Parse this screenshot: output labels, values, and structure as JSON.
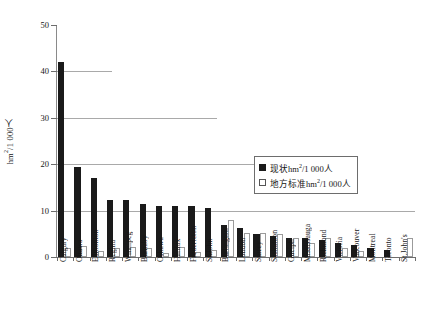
{
  "chart_data": {
    "type": "bar",
    "title": "",
    "xlabel": "",
    "ylabel": "hm²/1 000人",
    "ylim": [
      0,
      50
    ],
    "yticks": [
      0,
      10,
      20,
      30,
      40,
      50
    ],
    "grid": true,
    "legend_position": "center-right",
    "categories": [
      "Calgary",
      "Ottawa",
      "Edmonton",
      "Regina",
      "Winnipeg",
      "Burnaby",
      "Oshawa",
      "Halifax",
      "Fredericton",
      "St.John",
      "Burlington",
      "London",
      "Surrey",
      "Saskatoon",
      "Guelph",
      "Mississauga",
      "Richmond",
      "Victoria",
      "Vancouver",
      "Montreal",
      "Toronto",
      "St.John's"
    ],
    "series": [
      {
        "name": "现状hm²/1 000人",
        "color": "#1a1a1a",
        "values": [
          42.0,
          19.5,
          17.0,
          12.3,
          12.3,
          11.5,
          11.0,
          11.0,
          11.0,
          10.5,
          7.0,
          6.2,
          5.0,
          4.6,
          4.2,
          4.0,
          3.6,
          3.0,
          2.6,
          2.0,
          1.5,
          0.0
        ]
      },
      {
        "name": "地方标准hm²/1 000人",
        "color": "#ffffff",
        "values": [
          2.0,
          2.3,
          1.2,
          2.0,
          2.2,
          2.0,
          0.8,
          2.2,
          1.0,
          1.5,
          8.0,
          5.2,
          5.2,
          5.0,
          4.0,
          3.0,
          4.0,
          2.0,
          1.2,
          0.0,
          0.0,
          4.0
        ]
      }
    ]
  },
  "axis": {
    "y_label": "hm",
    "y_label_sup": "2",
    "y_label_rest": "/1 000人",
    "tick_labels": [
      "0",
      "10",
      "20",
      "30",
      "40",
      "50"
    ]
  },
  "legend": {
    "items": [
      {
        "swatch": "filled",
        "prefix": "现状hm",
        "sup": "2",
        "suffix": "/1 000人"
      },
      {
        "swatch": "hollow",
        "prefix": "地方标准hm",
        "sup": "2",
        "suffix": "/1 000人"
      }
    ]
  }
}
